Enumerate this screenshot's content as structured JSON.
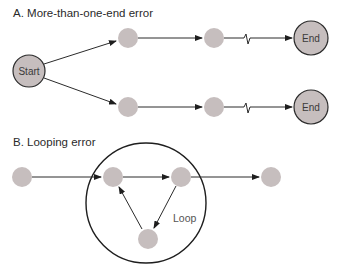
{
  "diagram": {
    "section_a": {
      "title": "A. More-than-one-end error",
      "start_label": "Start",
      "end_labels": [
        "End",
        "End"
      ]
    },
    "section_b": {
      "title": "B. Looping error",
      "loop_label": "Loop"
    },
    "colors": {
      "node_fill": "#c6bebe",
      "stroke": "#2b2b2b",
      "text": "#2a2a2a"
    }
  }
}
